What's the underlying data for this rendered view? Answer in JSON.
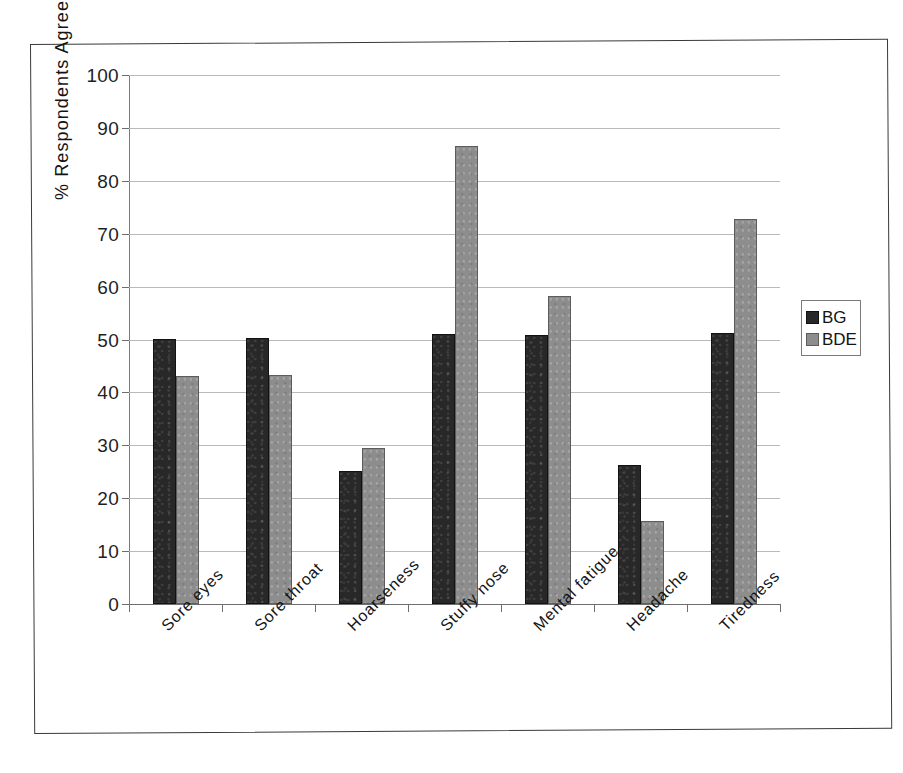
{
  "chart_data": {
    "type": "bar",
    "title": "",
    "xlabel": "",
    "ylabel": "% Respondents Agreeing",
    "ylim": [
      0,
      100
    ],
    "ytick_interval": 10,
    "yticks": [
      0,
      10,
      20,
      30,
      40,
      50,
      60,
      70,
      80,
      90,
      100
    ],
    "grid": true,
    "legend_position": "right",
    "categories": [
      "Sore eyes",
      "Sore throat",
      "Hoarseness",
      "Stuffy nose",
      "Mental fatigue",
      "Headache",
      "Tiredness"
    ],
    "series": [
      {
        "name": "BG",
        "color": "#282828",
        "values": [
          50.1,
          50.3,
          25.1,
          51.0,
          50.9,
          26.3,
          51.3
        ]
      },
      {
        "name": "BDE",
        "color": "#8d8d8d",
        "values": [
          43.1,
          43.2,
          29.4,
          86.6,
          58.2,
          15.6,
          72.8
        ]
      }
    ]
  },
  "axis": {
    "y_title": "% Respondents Agreeing",
    "tick_labels": [
      "0",
      "10",
      "20",
      "30",
      "40",
      "50",
      "60",
      "70",
      "80",
      "90",
      "100"
    ]
  },
  "legend": {
    "items": [
      {
        "label": "BG",
        "swatch": "dark-square-swatch"
      },
      {
        "label": "BDE",
        "swatch": "gray-square-swatch"
      }
    ]
  }
}
